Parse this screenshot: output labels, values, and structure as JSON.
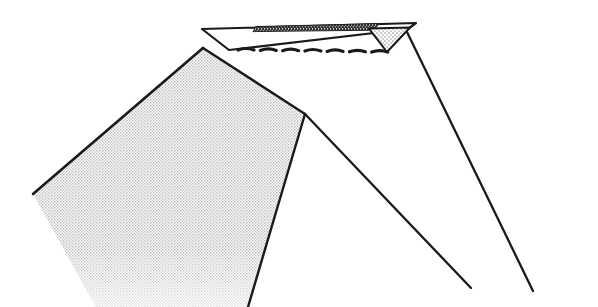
{
  "figure": {
    "canvas": {
      "width": 598,
      "height": 307
    },
    "background_color": "#ffffff",
    "ink_color": "#1a1a1a",
    "stipple_fill_color": "#d8d8d8",
    "dark_strip_color": "#2b2b2b",
    "elements": [
      {
        "name": "top-plate",
        "kind": "polygon",
        "description": "Thin flat quadrilateral plate at the top, wider at the top edge and narrower at the bottom edge",
        "points": "202,29 415,24 408,28 228,50"
      },
      {
        "name": "top-dark-strip",
        "kind": "polygon",
        "description": "Dark hatched strip running along the upper edge of the top plate",
        "points": "256,26 378,24 372,30 252,31"
      },
      {
        "name": "right-stipple-triangle",
        "kind": "polygon",
        "description": "Small stippled triangle at the right end of the top plate",
        "points": "369,29 410,27 387,52"
      },
      {
        "name": "left-stipple-band",
        "kind": "polygon",
        "description": "Wide stippled band descending from the plate's left vertex toward the lower left, exiting the frame",
        "points": "203,48 305,114 248,307 96,307 33,194"
      },
      {
        "name": "beam-line-outer-right",
        "kind": "line",
        "description": "Thin diagonal line from the plate's right vertex descending to the lower right corner",
        "x1": 406,
        "y1": 30,
        "x2": 533,
        "y2": 291
      },
      {
        "name": "beam-line-inner-right",
        "kind": "line",
        "description": "Thin diagonal line from the band corner descending to the lower right",
        "x1": 305,
        "y1": 114,
        "x2": 471,
        "y2": 288
      },
      {
        "name": "beam-line-upper-right",
        "kind": "line",
        "description": "Thin diagonal line from the plate's lower-left vertex up to the right vertex region",
        "x1": 203,
        "y1": 48,
        "x2": 408,
        "y2": 29
      },
      {
        "name": "dashed-arc-row",
        "kind": "dashes",
        "description": "Row of short arched dashes beneath the top plate",
        "count": 7,
        "y": 50,
        "x_start": 238,
        "x_end": 394,
        "dash_width": 16,
        "arc_rise": 3
      }
    ]
  }
}
